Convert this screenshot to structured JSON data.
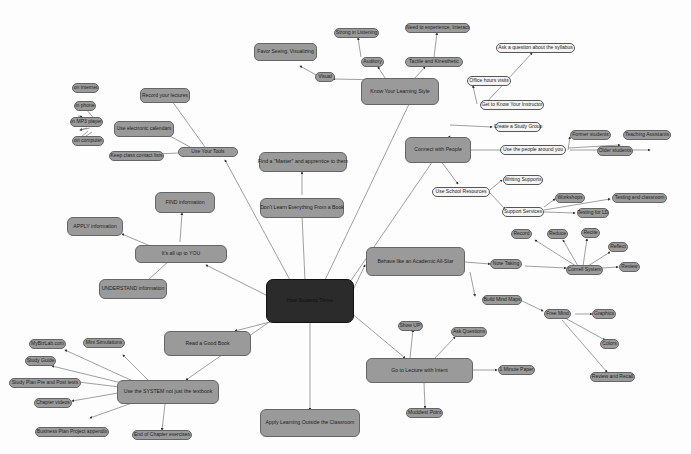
{
  "center": {
    "label": "How Students Thrive"
  },
  "nodes": {
    "know_style": "Know Your Learning Style",
    "visual": "Visual",
    "favor_seeing": "Favor Seeing, Visualizing",
    "auditory": "Auditory",
    "strong_listening": "Strong in Listening",
    "tactile": "Tactile and Kinesthetic",
    "need_experience": "Need to experience, Interact",
    "know_instructor": "Get to Know Your Instructor",
    "ask_syllabus": "Ask a question about the syllabus",
    "office_hours": "Office hours visits",
    "connect": "Connect with People",
    "study_group": "Create a Study Group",
    "use_people": "Use the people around you",
    "former_students": "Former students",
    "teaching_assistants": "Teaching Assistants",
    "older_students": "Older students",
    "school_resources": "Use School Resources",
    "writing_supports": "Writing Supports",
    "support_services": "Support Services",
    "workshops": "Workshops",
    "testing_classroom": "Testing and classroom",
    "testing_ld": "Testing for LD",
    "behave": "Behave like an Academic All-Star",
    "note_taking": "Note Taking",
    "cornell": "Cornell System",
    "record": "Record",
    "reduce": "Reduce",
    "recite": "Recite",
    "reflect": "Reflect",
    "review": "Review",
    "mind_maps": "Build Mind Maps",
    "free_mind": "Free Mind",
    "graphics": "Graphics",
    "colors": "Colors",
    "review_recall": "Review and Recall",
    "lecture": "Go to Lecture with Intent",
    "show_up": "Show UP!",
    "ask_questions": "Ask Questions",
    "minute_paper": "1 Minute Paper",
    "muddiest": "Muddiest Point",
    "apply_outside": "Apply Learning Outside the Classroom",
    "good_book": "Read a Good Book",
    "use_system": "Use the SYSTEM not just the textbook",
    "mybizlab": "MyBizLab.com",
    "mini_sims": "Mini Simulations",
    "study_guide": "Study Guide",
    "study_plan": "Study Plan Pre and Post tests",
    "chapter_videos": "Chapter videos",
    "business_plan": "Business Plan Project appendix",
    "end_chapter": "End of Chapter exercises",
    "up_to_you": "It's all up to YOU",
    "find_info": "FIND information",
    "apply_info": "APPLY information",
    "understand_info": "UNDERSTAND information",
    "dont_learn": "Don't Learn Everything From a Book",
    "find_master": "Find a \"Master\" and apprentice to them",
    "use_tools": "Use Your Tools",
    "record_lectures": "Record your lectures",
    "calendars": "Use electronic calendars",
    "on_internet": "on internet",
    "in_phone": "in phone",
    "in_mp3": "in MP3 player",
    "on_computer": "on computer",
    "contact_lists": "Keep class contact lists"
  },
  "colors": {
    "node_fill": "#9a9a9a",
    "light_fill": "#f4f4f4",
    "center_fill": "#2b2b2b",
    "edge": "#555555",
    "background": "#fdfdfd"
  }
}
